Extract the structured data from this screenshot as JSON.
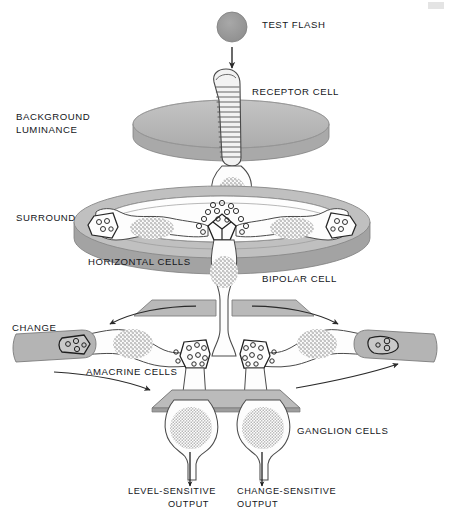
{
  "figure": {
    "background_color": "#ffffff",
    "width": 450,
    "height": 520
  },
  "palette": {
    "ink": "#14161a",
    "outline": "#3b3b3b",
    "light_outline": "#6e6e6e",
    "disc_fill": "#b6b6b6",
    "disc_edge": "#8f8f8f",
    "plate_fill": "#bdbdbd",
    "plate_edge": "#8a8a8a",
    "flash_fill": "#9a9a9a",
    "flash_edge": "#7d7d7d",
    "cell_fill": "#fdfdfd",
    "nucleus_stipple": "#7a7a7a",
    "arrow": "#2a2a2a",
    "white": "#ffffff"
  },
  "labels": {
    "test_flash": "TEST FLASH",
    "receptor_cell": "RECEPTOR CELL",
    "background_luminance_line1": "BACKGROUND",
    "background_luminance_line2": "LUMINANCE",
    "surround": "SURROUND",
    "horizontal_cells": "HORIZONTAL CELLS",
    "bipolar_cell": "BIPOLAR CELL",
    "change": "CHANGE",
    "amacrine_cells": "AMACRINE CELLS",
    "ganglion_cells": "GANGLION CELLS",
    "level_sensitive_output_line1": "LEVEL-SENSITIVE",
    "level_sensitive_output_line2": "OUTPUT",
    "change_sensitive_output_line1": "CHANGE-SENSITIVE",
    "change_sensitive_output_line2": "OUTPUT"
  },
  "label_positions": {
    "test_flash": {
      "x": 262,
      "y": 28,
      "anchor": "start"
    },
    "receptor_cell": {
      "x": 252,
      "y": 95,
      "anchor": "start"
    },
    "background_luminance_line1": {
      "x": 16,
      "y": 120,
      "anchor": "start"
    },
    "background_luminance_line2": {
      "x": 16,
      "y": 133,
      "anchor": "start"
    },
    "surround": {
      "x": 16,
      "y": 221,
      "anchor": "start"
    },
    "horizontal_cells": {
      "x": 88,
      "y": 265,
      "anchor": "start"
    },
    "bipolar_cell": {
      "x": 262,
      "y": 282,
      "anchor": "start"
    },
    "change": {
      "x": 12,
      "y": 331,
      "anchor": "start"
    },
    "amacrine_cells": {
      "x": 86,
      "y": 375,
      "anchor": "start"
    },
    "ganglion_cells": {
      "x": 297,
      "y": 434,
      "anchor": "start"
    },
    "level_sensitive_output_line1": {
      "x": 128,
      "y": 494,
      "anchor": "start"
    },
    "level_sensitive_output_line2": {
      "x": 209,
      "y": 507,
      "anchor": "end"
    },
    "change_sensitive_output_line1": {
      "x": 237,
      "y": 494,
      "anchor": "start"
    },
    "change_sensitive_output_line2": {
      "x": 237,
      "y": 507,
      "anchor": "start"
    }
  },
  "layers": [
    {
      "name": "test-flash",
      "type": "stimulus",
      "shape": "filled-circle",
      "cx": 232,
      "cy": 27,
      "r": 15
    },
    {
      "name": "background-luminance-disc",
      "type": "stimulus",
      "shape": "ellipse-slab",
      "cx": 231,
      "cy": 124,
      "rx": 98,
      "ry": 24
    },
    {
      "name": "surround-annulus",
      "type": "stimulus",
      "shape": "annulus-slab",
      "cx": 222,
      "cy": 222,
      "rx": 148,
      "ry": 36
    },
    {
      "name": "bipolar-plate",
      "type": "structure",
      "shape": "parallelogram-pair",
      "cy": 309
    },
    {
      "name": "ganglion-plate",
      "type": "structure",
      "shape": "trapezoid",
      "cy": 400
    }
  ],
  "cells": [
    {
      "name": "receptor-cell",
      "count": 1,
      "feature": "striped outer segment with stacked discs"
    },
    {
      "name": "horizontal-cell-left",
      "count": 1,
      "feature": "stippled nucleus, synaptic terminal in surround ring"
    },
    {
      "name": "horizontal-cell-right",
      "count": 1,
      "feature": "stippled nucleus, synaptic terminal in surround ring"
    },
    {
      "name": "bipolar-cell",
      "count": 1,
      "feature": "stippled nucleus, vertical through-pathway"
    },
    {
      "name": "amacrine-cell-left",
      "count": 1,
      "feature": "stippled nucleus with lateral process to change terminal"
    },
    {
      "name": "amacrine-cell-right",
      "count": 1,
      "feature": "stippled nucleus with lateral process to change terminal"
    },
    {
      "name": "ganglion-cell-left",
      "count": 1,
      "feature": "stippled nucleus, level-sensitive axon output"
    },
    {
      "name": "ganglion-cell-right",
      "count": 1,
      "feature": "stippled nucleus, change-sensitive axon output"
    }
  ],
  "arrows": [
    {
      "name": "test-flash-arrow",
      "direction": "down",
      "from": [
        232,
        46
      ],
      "to": [
        232,
        68
      ]
    },
    {
      "name": "change-inflow-arrow-left",
      "direction": "left",
      "note": "curves from center toward left change terminal"
    },
    {
      "name": "change-inflow-arrow-right",
      "direction": "right",
      "note": "curves from center toward right change terminal"
    },
    {
      "name": "change-outflow-arrow-left",
      "direction": "right",
      "note": "curves from left terminal toward ganglion layer"
    },
    {
      "name": "change-outflow-arrow-right",
      "direction": "right",
      "note": "curves from right terminal upward and out"
    },
    {
      "name": "level-sensitive-output-arrow",
      "direction": "down",
      "from": [
        190,
        470
      ],
      "to": [
        190,
        486
      ]
    },
    {
      "name": "change-sensitive-output-arrow",
      "direction": "down",
      "from": [
        262,
        470
      ],
      "to": [
        262,
        486
      ]
    }
  ]
}
